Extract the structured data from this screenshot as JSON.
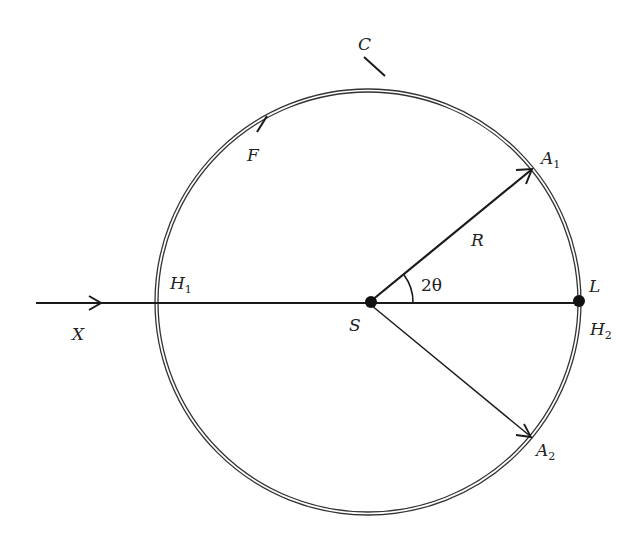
{
  "diagram": {
    "labels": {
      "C": "C",
      "F": "F",
      "A1": "A",
      "A1_sub": "1",
      "A2": "A",
      "A2_sub": "2",
      "R": "R",
      "angle": "2θ",
      "S": "S",
      "L": "L",
      "H1": "H",
      "H1_sub": "1",
      "H2": "H",
      "H2_sub": "2",
      "X": "X"
    },
    "colors": {
      "line": "#1a1a1a",
      "circle": "#333333",
      "background": "#ffffff"
    }
  }
}
